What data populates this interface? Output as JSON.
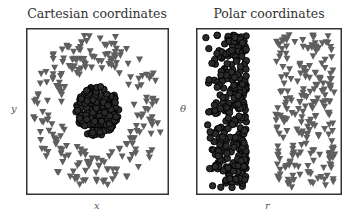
{
  "chart_data": [
    {
      "type": "scatter",
      "title": "Cartesian coordinates",
      "xlabel": "x",
      "ylabel": "y",
      "grid": false,
      "ticks": false,
      "series": [
        {
          "name": "inner class",
          "marker": "circle",
          "color": "#2b2b2b",
          "edge": "#000000",
          "count": 220,
          "distribution": "disk",
          "r_range": [
            0,
            0.33
          ]
        },
        {
          "name": "outer class",
          "marker": "triangle-down",
          "color": "#5f5f5f",
          "count": 220,
          "distribution": "ring",
          "r_range": [
            0.55,
            1.0
          ]
        }
      ]
    },
    {
      "type": "scatter",
      "title": "Polar coordinates",
      "xlabel": "r",
      "ylabel": "θ",
      "grid": false,
      "ticks": false,
      "series": [
        {
          "name": "inner class",
          "marker": "circle",
          "color": "#2b2b2b",
          "edge": "#000000",
          "count": 320,
          "r_range": [
            0,
            0.33
          ]
        },
        {
          "name": "outer class",
          "marker": "triangle-down",
          "color": "#5f5f5f",
          "count": 220,
          "r_range": [
            0.55,
            1.0
          ]
        }
      ]
    }
  ],
  "panels": {
    "left": {
      "title": "Cartesian coordinates",
      "xlabel": "x",
      "ylabel": "y"
    },
    "right": {
      "title": "Polar coordinates",
      "xlabel": "r",
      "ylabel": "θ"
    }
  }
}
